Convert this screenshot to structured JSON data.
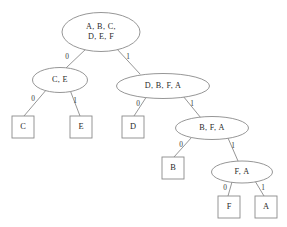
{
  "diagram": {
    "type": "binary-tree",
    "background_color": "#ffffff",
    "stroke_color": "#8a8a8a",
    "text_color": "#2a2a2a",
    "canvas": {
      "width": 287,
      "height": 227
    },
    "internal_nodes": [
      {
        "id": "root",
        "shape": "ellipse",
        "lines": [
          "A, B, C,",
          "D, E, F"
        ],
        "cx": 101,
        "cy": 32,
        "rx": 39,
        "ry": 19.5
      },
      {
        "id": "n-ce",
        "shape": "ellipse",
        "lines": [
          "C, E"
        ],
        "cx": 60,
        "cy": 80,
        "rx": 27.5,
        "ry": 12.5
      },
      {
        "id": "n-dbfa",
        "shape": "ellipse",
        "lines": [
          "D, B, F, A"
        ],
        "cx": 163,
        "cy": 86,
        "rx": 46.5,
        "ry": 12.5
      },
      {
        "id": "n-bfa",
        "shape": "ellipse",
        "lines": [
          "B, F, A"
        ],
        "cx": 212,
        "cy": 128,
        "rx": 36.5,
        "ry": 11.5
      },
      {
        "id": "n-fa",
        "shape": "ellipse",
        "lines": [
          "F, A"
        ],
        "cx": 242,
        "cy": 172,
        "rx": 30.5,
        "ry": 11
      }
    ],
    "leaf_nodes": [
      {
        "id": "leaf-c",
        "shape": "rect",
        "label": "C",
        "x": 12,
        "y": 116,
        "w": 22,
        "h": 22
      },
      {
        "id": "leaf-e",
        "shape": "rect",
        "label": "E",
        "x": 70,
        "y": 116,
        "w": 22,
        "h": 22
      },
      {
        "id": "leaf-d",
        "shape": "rect",
        "label": "D",
        "x": 122,
        "y": 116,
        "w": 22,
        "h": 22
      },
      {
        "id": "leaf-b",
        "shape": "rect",
        "label": "B",
        "x": 162,
        "y": 157,
        "w": 22,
        "h": 22
      },
      {
        "id": "leaf-f",
        "shape": "rect",
        "label": "F",
        "x": 218,
        "y": 196,
        "w": 22,
        "h": 22
      },
      {
        "id": "leaf-a",
        "shape": "rect",
        "label": "A",
        "x": 255,
        "y": 196,
        "w": 22,
        "h": 22
      }
    ],
    "edges": [
      {
        "id": "e-root-ce",
        "from": "root",
        "to": "n-ce",
        "label": "0",
        "x1": 87,
        "y1": 48,
        "x2": 66,
        "y2": 68,
        "lx": 67,
        "ly": 57
      },
      {
        "id": "e-root-dbfa",
        "from": "root",
        "to": "n-dbfa",
        "label": "1",
        "x1": 116,
        "y1": 48,
        "x2": 140,
        "y2": 74,
        "lx": 128,
        "ly": 57
      },
      {
        "id": "e-ce-c",
        "from": "n-ce",
        "to": "leaf-c",
        "label": "0",
        "x1": 47,
        "y1": 89,
        "x2": 24,
        "y2": 116,
        "lx": 33,
        "ly": 99
      },
      {
        "id": "e-ce-e",
        "from": "n-ce",
        "to": "leaf-e",
        "label": "1",
        "x1": 70,
        "y1": 90,
        "x2": 80,
        "y2": 116,
        "lx": 75,
        "ly": 101
      },
      {
        "id": "e-dbfa-d",
        "from": "n-dbfa",
        "to": "leaf-d",
        "label": "0",
        "x1": 147,
        "y1": 96,
        "x2": 134,
        "y2": 116,
        "lx": 138,
        "ly": 104
      },
      {
        "id": "e-dbfa-bfa",
        "from": "n-dbfa",
        "to": "n-bfa",
        "label": "1",
        "x1": 183,
        "y1": 96,
        "x2": 201,
        "y2": 118,
        "lx": 192,
        "ly": 104
      },
      {
        "id": "e-bfa-b",
        "from": "n-bfa",
        "to": "leaf-b",
        "label": "0",
        "x1": 192,
        "y1": 137,
        "x2": 174,
        "y2": 157,
        "lx": 181,
        "ly": 145
      },
      {
        "id": "e-bfa-fa",
        "from": "n-bfa",
        "to": "n-fa",
        "label": "1",
        "x1": 228,
        "y1": 138,
        "x2": 238,
        "y2": 161,
        "lx": 233,
        "ly": 146
      },
      {
        "id": "e-fa-f",
        "from": "n-fa",
        "to": "leaf-f",
        "label": "0",
        "x1": 232,
        "y1": 182,
        "x2": 228,
        "y2": 196,
        "lx": 225,
        "ly": 188
      },
      {
        "id": "e-fa-a",
        "from": "n-fa",
        "to": "leaf-a",
        "label": "1",
        "x1": 255,
        "y1": 181,
        "x2": 264,
        "y2": 196,
        "lx": 263,
        "ly": 188
      }
    ]
  }
}
